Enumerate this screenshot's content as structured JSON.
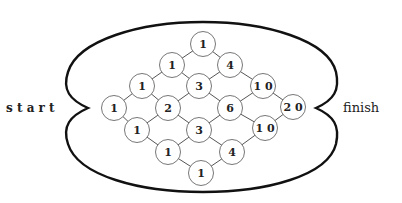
{
  "labels": {
    "start": "s t a r t",
    "finish": "finish"
  },
  "colors": {
    "outline": "#111111",
    "node_stroke": "#777777",
    "edge": "#555555",
    "text": "#222222"
  },
  "nodes": [
    {
      "id": "n0",
      "value": "1",
      "x": 114,
      "y": 108
    },
    {
      "id": "n1",
      "value": "1",
      "x": 142,
      "y": 86
    },
    {
      "id": "n2",
      "value": "1",
      "x": 172,
      "y": 65
    },
    {
      "id": "n3",
      "value": "1",
      "x": 203,
      "y": 44
    },
    {
      "id": "n4",
      "value": "1",
      "x": 137,
      "y": 130
    },
    {
      "id": "n5",
      "value": "2",
      "x": 168,
      "y": 108
    },
    {
      "id": "n6",
      "value": "3",
      "x": 199,
      "y": 86
    },
    {
      "id": "n7",
      "value": "4",
      "x": 230,
      "y": 65
    },
    {
      "id": "n8",
      "value": "1",
      "x": 168,
      "y": 152
    },
    {
      "id": "n9",
      "value": "3",
      "x": 199,
      "y": 130
    },
    {
      "id": "n10",
      "value": "6",
      "x": 230,
      "y": 108
    },
    {
      "id": "n11",
      "value": "10",
      "x": 263,
      "y": 86
    },
    {
      "id": "n12",
      "value": "1",
      "x": 201,
      "y": 173
    },
    {
      "id": "n13",
      "value": "4",
      "x": 232,
      "y": 152
    },
    {
      "id": "n14",
      "value": "10",
      "x": 265,
      "y": 128
    },
    {
      "id": "n15",
      "value": "20",
      "x": 293,
      "y": 107
    }
  ],
  "edges": [
    [
      "n0",
      "n1"
    ],
    [
      "n1",
      "n2"
    ],
    [
      "n2",
      "n3"
    ],
    [
      "n0",
      "n4"
    ],
    [
      "n1",
      "n5"
    ],
    [
      "n2",
      "n6"
    ],
    [
      "n3",
      "n7"
    ],
    [
      "n4",
      "n5"
    ],
    [
      "n5",
      "n6"
    ],
    [
      "n6",
      "n7"
    ],
    [
      "n4",
      "n8"
    ],
    [
      "n5",
      "n9"
    ],
    [
      "n6",
      "n10"
    ],
    [
      "n7",
      "n11"
    ],
    [
      "n8",
      "n9"
    ],
    [
      "n9",
      "n10"
    ],
    [
      "n10",
      "n11"
    ],
    [
      "n8",
      "n12"
    ],
    [
      "n9",
      "n13"
    ],
    [
      "n10",
      "n14"
    ],
    [
      "n11",
      "n15"
    ],
    [
      "n12",
      "n13"
    ],
    [
      "n13",
      "n14"
    ],
    [
      "n14",
      "n15"
    ]
  ]
}
